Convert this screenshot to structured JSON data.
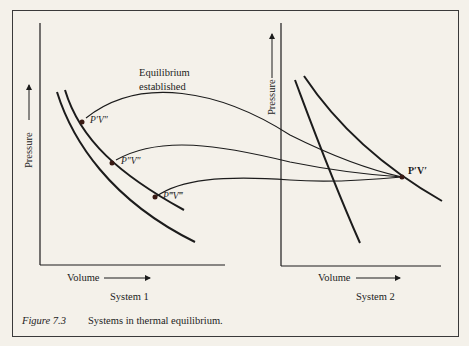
{
  "figure": {
    "number": "Figure 7.3",
    "caption": "Systems in thermal equilibrium."
  },
  "annotation": {
    "line1": "Equilibrium",
    "line2": "established"
  },
  "system1": {
    "title": "System 1",
    "x_axis_label": "Volume",
    "y_axis_label": "Pressure",
    "points": [
      {
        "label": "P′V″"
      },
      {
        "label": "P″V″"
      },
      {
        "label": "P‴V‴"
      }
    ]
  },
  "system2": {
    "title": "System 2",
    "x_axis_label": "Volume",
    "y_axis_label": "Pressure",
    "point": {
      "label": "P′V′"
    }
  },
  "colors": {
    "background": "#f4f1ea",
    "ink": "#1c1c1c",
    "point_fill": "#3a1a14"
  }
}
